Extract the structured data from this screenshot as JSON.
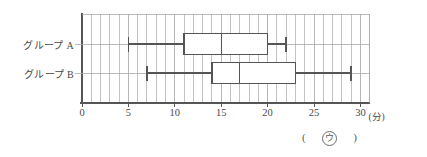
{
  "chart_data": {
    "type": "box",
    "title": "",
    "xlabel": "(分)",
    "ylabel": "",
    "xlim": [
      0,
      31
    ],
    "xticks": [
      0,
      5,
      10,
      15,
      20,
      25,
      30
    ],
    "xtick_labels": [
      "0",
      "5",
      "10",
      "15",
      "20",
      "25",
      "30"
    ],
    "minor_tick_step": 1,
    "grid": true,
    "grid_orientation": "vertical",
    "orientation": "horizontal",
    "legend": "none",
    "categories": [
      "グループ A",
      "グループ B"
    ],
    "series": [
      {
        "name": "グループ A",
        "min": 5,
        "q1": 11,
        "median": 15,
        "q3": 20,
        "max": 22
      },
      {
        "name": "グループ B",
        "min": 7,
        "q1": 14,
        "median": 17,
        "q3": 23,
        "max": 29
      }
    ],
    "unit": "分",
    "colors": {
      "line": "#555555",
      "grid": "#aaaaaa",
      "box_fill": "#ffffff",
      "frame": "#555555",
      "text": "#4a4a4a"
    }
  },
  "annotation": {
    "open_paren": "(",
    "marker": "ウ",
    "close_paren": ")"
  }
}
